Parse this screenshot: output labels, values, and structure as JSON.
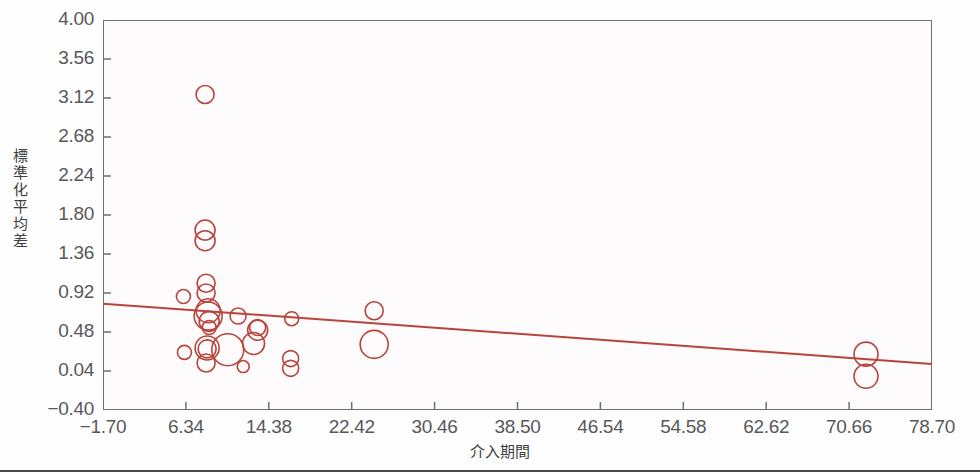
{
  "chart_data": {
    "type": "scatter",
    "title": "",
    "xlabel": "介入期間",
    "ylabel": "標準化平均差",
    "xlim": [
      -1.7,
      78.7
    ],
    "ylim": [
      -0.4,
      4.0
    ],
    "xticks": [
      "-1.70",
      "6.34",
      "14.38",
      "22.42",
      "30.46",
      "38.50",
      "46.54",
      "54.58",
      "62.62",
      "70.66",
      "78.70"
    ],
    "yticks": [
      "4.00",
      "3.56",
      "3.12",
      "2.68",
      "2.24",
      "1.80",
      "1.36",
      "0.92",
      "0.48",
      "0.04",
      "-0.40"
    ],
    "xtick_step": 8.04,
    "ytick_step": 0.44,
    "grid": false,
    "legend": null,
    "marker": "open-circle",
    "marker_color": "#b8443c",
    "series": [
      {
        "name": "研究",
        "points": [
          {
            "x": 8.2,
            "y": 3.16,
            "r": 9
          },
          {
            "x": 8.2,
            "y": 1.63,
            "r": 10
          },
          {
            "x": 8.2,
            "y": 1.51,
            "r": 10
          },
          {
            "x": 6.1,
            "y": 0.88,
            "r": 7
          },
          {
            "x": 8.3,
            "y": 1.03,
            "r": 9
          },
          {
            "x": 8.3,
            "y": 0.92,
            "r": 9
          },
          {
            "x": 8.5,
            "y": 0.72,
            "r": 12
          },
          {
            "x": 8.5,
            "y": 0.66,
            "r": 14
          },
          {
            "x": 8.6,
            "y": 0.6,
            "r": 10
          },
          {
            "x": 8.6,
            "y": 0.53,
            "r": 7
          },
          {
            "x": 11.4,
            "y": 0.66,
            "r": 8
          },
          {
            "x": 13.3,
            "y": 0.53,
            "r": 8
          },
          {
            "x": 13.3,
            "y": 0.5,
            "r": 10
          },
          {
            "x": 8.4,
            "y": 0.3,
            "r": 12
          },
          {
            "x": 8.4,
            "y": 0.29,
            "r": 9
          },
          {
            "x": 10.4,
            "y": 0.28,
            "r": 16
          },
          {
            "x": 12.9,
            "y": 0.35,
            "r": 11
          },
          {
            "x": 6.2,
            "y": 0.25,
            "r": 7
          },
          {
            "x": 8.3,
            "y": 0.13,
            "r": 9
          },
          {
            "x": 11.9,
            "y": 0.09,
            "r": 6
          },
          {
            "x": 16.6,
            "y": 0.63,
            "r": 7
          },
          {
            "x": 24.6,
            "y": 0.72,
            "r": 9
          },
          {
            "x": 24.6,
            "y": 0.34,
            "r": 14
          },
          {
            "x": 16.5,
            "y": 0.18,
            "r": 8
          },
          {
            "x": 16.5,
            "y": 0.07,
            "r": 8
          },
          {
            "x": 72.3,
            "y": 0.23,
            "r": 12
          },
          {
            "x": 72.3,
            "y": -0.02,
            "r": 12
          }
        ]
      }
    ],
    "trend_line": {
      "x_start": -1.7,
      "y_start": 0.8,
      "x_end": 78.7,
      "y_end": 0.12,
      "color": "#b8443c"
    }
  }
}
